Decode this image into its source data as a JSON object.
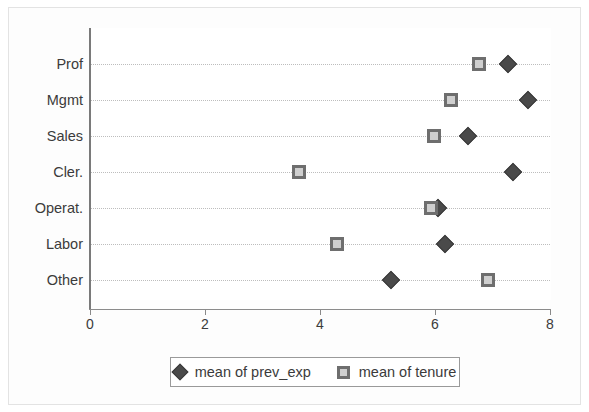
{
  "chart_data": {
    "type": "scatter",
    "title": "",
    "xlabel": "",
    "ylabel": "",
    "orientation": "horizontal",
    "categories": [
      "Prof",
      "Mgmt",
      "Sales",
      "Cler.",
      "Operat.",
      "Labor",
      "Other"
    ],
    "xticks": [
      "0",
      "2",
      "4",
      "6",
      "8"
    ],
    "xtick_values": [
      0,
      2,
      4,
      6,
      8
    ],
    "xlim": [
      0,
      8
    ],
    "grid": "dotted-horizontal",
    "legend_position": "bottom-center",
    "series": [
      {
        "name": "mean of prev_exp",
        "marker": "diamond",
        "color": "#4a4a4a",
        "values": [
          7.27,
          7.62,
          6.57,
          7.36,
          6.05,
          6.17,
          5.23
        ]
      },
      {
        "name": "mean of tenure",
        "marker": "square",
        "color": "#6e6e6e",
        "values": [
          6.77,
          6.28,
          5.98,
          3.63,
          5.93,
          4.3,
          6.92
        ]
      }
    ]
  },
  "legend": {
    "items": [
      {
        "label": "mean of prev_exp",
        "marker": "diamond"
      },
      {
        "label": "mean of tenure",
        "marker": "square"
      }
    ]
  },
  "colors": {
    "prev_exp": "#4a4a4a",
    "tenure": "#6e6e6e",
    "grid": "#bdbdbd",
    "axis": "#8a8a8a",
    "text": "#3b3b3b"
  }
}
